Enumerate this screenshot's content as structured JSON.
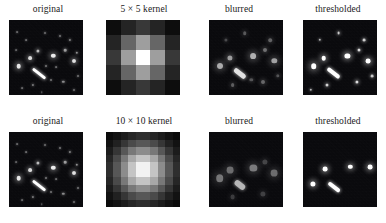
{
  "figure": {
    "background_color": "#ffffff",
    "panel_background_color": "#07070a",
    "rows": [
      {
        "kernel_size": 5,
        "panels": [
          {
            "label": "original",
            "type": "image",
            "name": "original"
          },
          {
            "label_prefix": "5",
            "label_times": "×",
            "label_suffix": "5 kernel",
            "label": "5 × 5 kernel",
            "type": "kernel",
            "name": "kernel-5x5"
          },
          {
            "label": "blurred",
            "type": "image",
            "name": "blurred"
          },
          {
            "label": "thresholded",
            "type": "image",
            "name": "thresholded"
          }
        ]
      },
      {
        "kernel_size": 10,
        "panels": [
          {
            "label": "original",
            "type": "image",
            "name": "original"
          },
          {
            "label_prefix": "10",
            "label_times": "×",
            "label_suffix": "10 kernel",
            "label": "10 × 10 kernel",
            "type": "kernel",
            "name": "kernel-10x10"
          },
          {
            "label": "blurred",
            "type": "image",
            "name": "blurred"
          },
          {
            "label": "thresholded",
            "type": "image",
            "name": "thresholded"
          }
        ]
      }
    ]
  },
  "chart_data": {
    "type": "heatmap",
    "grid": false,
    "legend": "none",
    "panel_labels_row1": [
      "original",
      "5 × 5 kernel",
      "blurred",
      "thresholded"
    ],
    "panel_labels_row2": [
      "original",
      "10 × 10 kernel",
      "blurred",
      "thresholded"
    ],
    "kernels": [
      {
        "name": "5 × 5 kernel",
        "size": [
          5,
          5
        ],
        "xlabel": "",
        "ylabel": "",
        "vmin": 0.0,
        "vmax": 1.0,
        "values": [
          [
            0.05,
            0.14,
            0.22,
            0.14,
            0.05
          ],
          [
            0.14,
            0.4,
            0.62,
            0.4,
            0.14
          ],
          [
            0.22,
            0.62,
            1.0,
            0.62,
            0.22
          ],
          [
            0.14,
            0.4,
            0.62,
            0.4,
            0.14
          ],
          [
            0.05,
            0.14,
            0.22,
            0.14,
            0.05
          ]
        ]
      },
      {
        "name": "10 × 10 kernel",
        "size": [
          10,
          10
        ],
        "xlabel": "",
        "ylabel": "",
        "vmin": 0.0,
        "vmax": 1.0,
        "values": [
          [
            0.04,
            0.07,
            0.11,
            0.15,
            0.18,
            0.18,
            0.15,
            0.11,
            0.07,
            0.04
          ],
          [
            0.07,
            0.13,
            0.21,
            0.29,
            0.34,
            0.34,
            0.29,
            0.21,
            0.13,
            0.07
          ],
          [
            0.11,
            0.21,
            0.34,
            0.47,
            0.55,
            0.55,
            0.47,
            0.34,
            0.21,
            0.11
          ],
          [
            0.15,
            0.29,
            0.47,
            0.66,
            0.77,
            0.77,
            0.66,
            0.47,
            0.29,
            0.15
          ],
          [
            0.18,
            0.34,
            0.55,
            0.77,
            0.95,
            0.95,
            0.77,
            0.55,
            0.34,
            0.18
          ],
          [
            0.18,
            0.34,
            0.55,
            0.77,
            0.95,
            0.95,
            0.77,
            0.55,
            0.34,
            0.18
          ],
          [
            0.15,
            0.29,
            0.47,
            0.66,
            0.77,
            0.77,
            0.66,
            0.47,
            0.29,
            0.15
          ],
          [
            0.11,
            0.21,
            0.34,
            0.47,
            0.55,
            0.55,
            0.47,
            0.34,
            0.21,
            0.11
          ],
          [
            0.07,
            0.13,
            0.21,
            0.29,
            0.34,
            0.34,
            0.29,
            0.21,
            0.13,
            0.07
          ],
          [
            0.04,
            0.07,
            0.11,
            0.15,
            0.18,
            0.18,
            0.15,
            0.11,
            0.07,
            0.04
          ]
        ]
      }
    ],
    "star_fields": {
      "original": {
        "streaks": [
          {
            "x": 30,
            "y": 54,
            "length": 16,
            "thickness": 3.4,
            "angle": 38,
            "brightness": 1.0
          }
        ],
        "stars": [
          {
            "x": 10,
            "y": 46,
            "r": 2.3,
            "b": 0.9
          },
          {
            "x": 21,
            "y": 38,
            "r": 1.9,
            "b": 0.85
          },
          {
            "x": 29,
            "y": 31,
            "r": 1.6,
            "b": 0.72
          },
          {
            "x": 45,
            "y": 36,
            "r": 2.2,
            "b": 0.92
          },
          {
            "x": 57,
            "y": 30,
            "r": 1.3,
            "b": 0.6
          },
          {
            "x": 66,
            "y": 41,
            "r": 2.0,
            "b": 0.88
          },
          {
            "x": 69,
            "y": 33,
            "r": 1.2,
            "b": 0.55
          },
          {
            "x": 62,
            "y": 20,
            "r": 1.1,
            "b": 0.5
          },
          {
            "x": 52,
            "y": 16,
            "r": 1.0,
            "b": 0.45
          },
          {
            "x": 36,
            "y": 13,
            "r": 1.0,
            "b": 0.42
          },
          {
            "x": 17,
            "y": 20,
            "r": 0.9,
            "b": 0.4
          },
          {
            "x": 8,
            "y": 12,
            "r": 0.9,
            "b": 0.38
          },
          {
            "x": 24,
            "y": 65,
            "r": 1.1,
            "b": 0.48
          },
          {
            "x": 43,
            "y": 60,
            "r": 1.0,
            "b": 0.44
          },
          {
            "x": 55,
            "y": 62,
            "r": 1.2,
            "b": 0.52
          },
          {
            "x": 66,
            "y": 70,
            "r": 1.0,
            "b": 0.42
          },
          {
            "x": 13,
            "y": 68,
            "r": 0.9,
            "b": 0.38
          },
          {
            "x": 38,
            "y": 46,
            "r": 1.0,
            "b": 0.46
          },
          {
            "x": 48,
            "y": 47,
            "r": 0.9,
            "b": 0.4
          },
          {
            "x": 7,
            "y": 30,
            "r": 0.9,
            "b": 0.36
          },
          {
            "x": 70,
            "y": 56,
            "r": 1.0,
            "b": 0.44
          },
          {
            "x": 33,
            "y": 72,
            "r": 0.8,
            "b": 0.34
          }
        ]
      },
      "blurred": {
        "streaks": [
          {
            "x": 31,
            "y": 53,
            "length": 14,
            "thickness": 4.6,
            "angle": 38,
            "brightness": 0.88
          }
        ],
        "stars": [
          {
            "x": 11,
            "y": 46,
            "r": 3.0,
            "b": 0.66
          },
          {
            "x": 21,
            "y": 38,
            "r": 2.6,
            "b": 0.6
          },
          {
            "x": 45,
            "y": 36,
            "r": 2.9,
            "b": 0.68
          },
          {
            "x": 66,
            "y": 41,
            "r": 2.7,
            "b": 0.62
          },
          {
            "x": 57,
            "y": 30,
            "r": 2.0,
            "b": 0.42
          },
          {
            "x": 62,
            "y": 20,
            "r": 1.8,
            "b": 0.36
          },
          {
            "x": 36,
            "y": 13,
            "r": 1.8,
            "b": 0.32
          },
          {
            "x": 24,
            "y": 65,
            "r": 1.9,
            "b": 0.34
          },
          {
            "x": 55,
            "y": 62,
            "r": 2.0,
            "b": 0.38
          },
          {
            "x": 43,
            "y": 60,
            "r": 1.7,
            "b": 0.3
          },
          {
            "x": 70,
            "y": 56,
            "r": 1.7,
            "b": 0.3
          },
          {
            "x": 17,
            "y": 20,
            "r": 1.6,
            "b": 0.26
          }
        ]
      },
      "thresholded": {
        "streaks": [
          {
            "x": 31,
            "y": 53,
            "length": 15,
            "thickness": 4.0,
            "angle": 38,
            "brightness": 1.0
          }
        ],
        "stars": [
          {
            "x": 11,
            "y": 46,
            "r": 2.8,
            "b": 1.0
          },
          {
            "x": 21,
            "y": 38,
            "r": 2.3,
            "b": 1.0
          },
          {
            "x": 45,
            "y": 36,
            "r": 2.6,
            "b": 1.0
          },
          {
            "x": 66,
            "y": 41,
            "r": 2.4,
            "b": 1.0
          },
          {
            "x": 57,
            "y": 30,
            "r": 1.5,
            "b": 0.85
          },
          {
            "x": 62,
            "y": 20,
            "r": 1.4,
            "b": 0.8
          },
          {
            "x": 36,
            "y": 13,
            "r": 1.4,
            "b": 0.78
          },
          {
            "x": 24,
            "y": 65,
            "r": 1.5,
            "b": 0.82
          },
          {
            "x": 55,
            "y": 62,
            "r": 1.6,
            "b": 0.86
          },
          {
            "x": 70,
            "y": 56,
            "r": 1.4,
            "b": 0.78
          },
          {
            "x": 17,
            "y": 20,
            "r": 1.2,
            "b": 0.7
          },
          {
            "x": 8,
            "y": 70,
            "r": 1.2,
            "b": 0.7
          }
        ]
      },
      "blurred10": {
        "streaks": [
          {
            "x": 31,
            "y": 53,
            "length": 12,
            "thickness": 5.6,
            "angle": 38,
            "brightness": 0.7
          }
        ],
        "stars": [
          {
            "x": 11,
            "y": 46,
            "r": 3.8,
            "b": 0.44
          },
          {
            "x": 21,
            "y": 38,
            "r": 3.4,
            "b": 0.4
          },
          {
            "x": 45,
            "y": 36,
            "r": 3.6,
            "b": 0.46
          },
          {
            "x": 66,
            "y": 41,
            "r": 3.4,
            "b": 0.4
          },
          {
            "x": 57,
            "y": 30,
            "r": 2.6,
            "b": 0.24
          },
          {
            "x": 55,
            "y": 62,
            "r": 2.6,
            "b": 0.22
          },
          {
            "x": 24,
            "y": 65,
            "r": 2.4,
            "b": 0.2
          }
        ]
      },
      "thresholded10": {
        "streaks": [
          {
            "x": 31,
            "y": 55,
            "length": 14,
            "thickness": 4.4,
            "angle": 38,
            "brightness": 1.0
          }
        ],
        "stars": [
          {
            "x": 10,
            "y": 52,
            "r": 2.6,
            "b": 1.0
          },
          {
            "x": 22,
            "y": 37,
            "r": 2.4,
            "b": 1.0
          },
          {
            "x": 48,
            "y": 35,
            "r": 2.2,
            "b": 1.0
          },
          {
            "x": 68,
            "y": 35,
            "r": 2.4,
            "b": 1.0
          }
        ]
      }
    }
  }
}
